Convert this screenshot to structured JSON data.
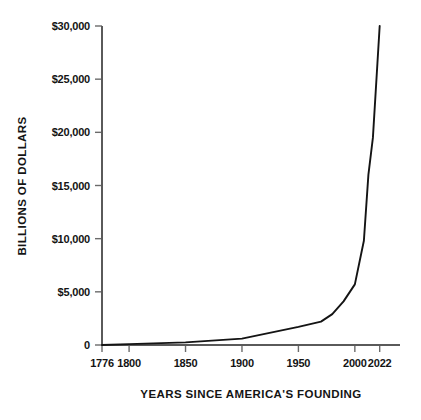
{
  "chart_data": {
    "type": "line",
    "title": "",
    "xlabel": "YEARS SINCE AMERICA'S FOUNDING",
    "ylabel": "BILLIONS OF DOLLARS",
    "xlim": [
      1776,
      2040
    ],
    "ylim": [
      0,
      30000
    ],
    "grid": false,
    "legend": false,
    "x_ticks": [
      1776,
      1800,
      1850,
      1900,
      1950,
      2000,
      2022
    ],
    "x_tick_labels": [
      "1776",
      "1800",
      "1850",
      "1900",
      "1950",
      "2000",
      "2022"
    ],
    "y_ticks": [
      0,
      5000,
      10000,
      15000,
      20000,
      25000,
      30000
    ],
    "y_tick_labels": [
      "0",
      "$5,000",
      "$10,000",
      "$15,000",
      "$20,000",
      "$25,000",
      "$30,000"
    ],
    "series": [
      {
        "name": "U.S. National Debt",
        "color": "#141414",
        "x": [
          1776,
          1800,
          1850,
          1900,
          1950,
          1970,
          1980,
          1990,
          2000,
          2008,
          2012,
          2016,
          2020,
          2022
        ],
        "y": [
          0,
          80,
          250,
          600,
          1700,
          2200,
          2900,
          4100,
          5700,
          9800,
          16000,
          19500,
          26500,
          30000
        ]
      }
    ]
  },
  "axis_color": "#5a5a5a",
  "tick_color": "#6b6b6b",
  "text_color": "#141414",
  "background": "#ffffff"
}
